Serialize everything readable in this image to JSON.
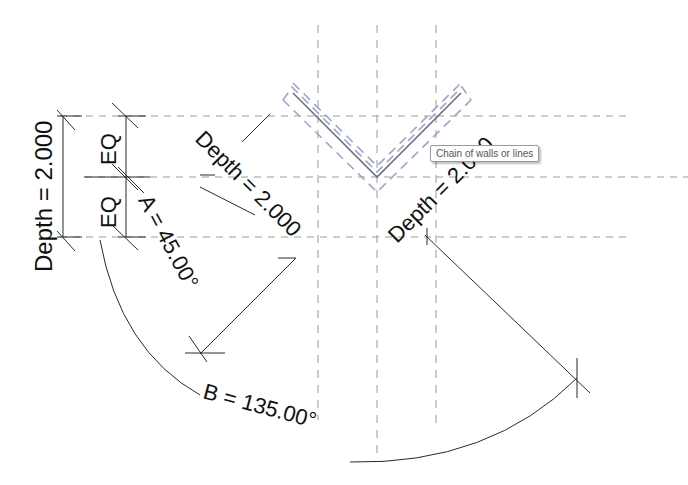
{
  "dimensions": {
    "depth_left": "Depth = 2.000",
    "eq_top": "EQ",
    "eq_bottom": "EQ",
    "angle_a": "A = 45.00°",
    "depth_diag_left": "Depth = 2.000",
    "depth_diag_right": "Depth = 2.000",
    "angle_b": "B = 135.00°"
  },
  "tooltip": {
    "text": "Chain of walls or lines"
  },
  "colors": {
    "reference_plane_horizontal": "#8aa88a",
    "reference_plane_vertical": "#9a9a9a",
    "wall_centerline": "#6d7187",
    "wall_outline_selected": "#9ea3cc",
    "dimension_line": "#2a2a2a"
  }
}
